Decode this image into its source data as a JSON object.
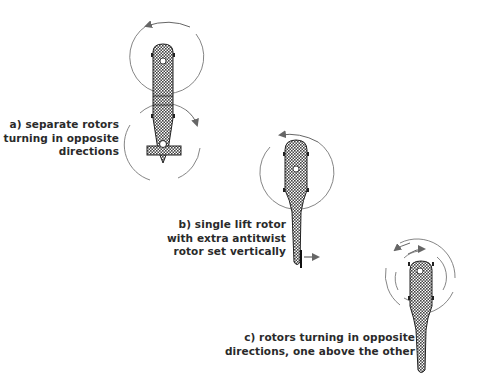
{
  "diagrams": [
    {
      "id": "a",
      "caption_lines": [
        "a) separate rotors",
        "turning in opposite",
        "directions"
      ],
      "rotor_config": "tandem"
    },
    {
      "id": "b",
      "caption_lines": [
        "b) single lift rotor",
        "with extra antitwist",
        "rotor set vertically"
      ],
      "rotor_config": "single-with-tail-rotor"
    },
    {
      "id": "c",
      "caption_lines": [
        "c) rotors turning in opposite",
        "directions, one above the other"
      ],
      "rotor_config": "coaxial"
    }
  ],
  "colors": {
    "ink": "#2a2a2a",
    "circle": "#777777",
    "arrow": "#666666",
    "fill_dot": "#999999",
    "background": "#ffffff"
  }
}
